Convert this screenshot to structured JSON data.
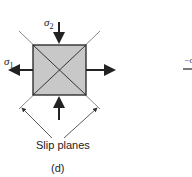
{
  "figure": {
    "panel_label": "(d)",
    "slip_label": "Slip planes",
    "sigma1": {
      "symbol": "σ",
      "sub": "1"
    },
    "sigma2": {
      "symbol": "σ",
      "sub": "2"
    },
    "clipped_right_fragment": "−σ"
  },
  "colors": {
    "fill": "#c8c8c8",
    "stroke": "#222222"
  }
}
